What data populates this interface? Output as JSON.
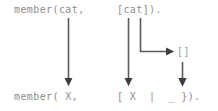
{
  "diagram": {
    "type": "unification-mapping",
    "colors": {
      "text": "#8d8d8d",
      "arrow": "#4a4a4a",
      "background": "#ffffff"
    },
    "top_row": {
      "functor_text": "member(cat,",
      "arg_text": "[cat])."
    },
    "middle_row": {
      "empty_list_text": "[]"
    },
    "bottom_row": {
      "functor_text": "member( X,",
      "arg_text": "[ X  |  _ })."
    },
    "arrows": [
      {
        "name": "arrow-cat-to-X",
        "kind": "vertical",
        "from_label": "cat",
        "to_label": "X"
      },
      {
        "name": "arrow-list-to-list",
        "kind": "vertical",
        "from_label": "[cat]",
        "to_label": "[ X | _ ]"
      },
      {
        "name": "arrow-list-to-emptylist",
        "kind": "elbow",
        "from_label": "[cat]",
        "to_label": "[]"
      },
      {
        "name": "arrow-emptylist-to-anon",
        "kind": "vertical",
        "from_label": "[]",
        "to_label": "_"
      }
    ]
  }
}
